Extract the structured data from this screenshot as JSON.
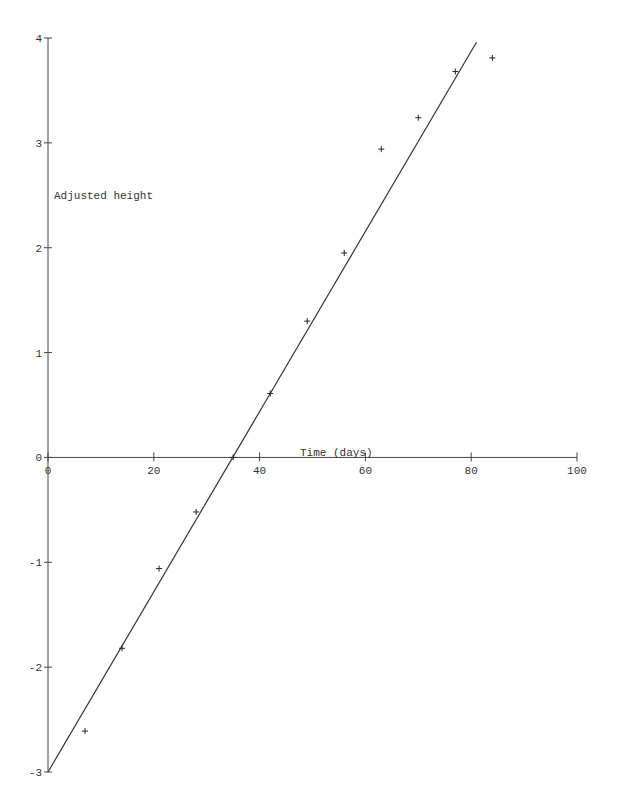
{
  "chart_data": {
    "type": "scatter",
    "title": "",
    "xlabel": "Time (days)",
    "ylabel": "Adjusted height",
    "xlim": [
      0,
      100
    ],
    "ylim": [
      -3,
      4
    ],
    "grid": false,
    "legend": null,
    "x_ticks": [
      0,
      20,
      40,
      60,
      80,
      100
    ],
    "y_ticks": [
      -3,
      -2,
      -1,
      0,
      1,
      2,
      3,
      4
    ],
    "series": [
      {
        "name": "Observed",
        "marker": "+",
        "x": [
          7,
          14,
          21,
          28,
          35,
          42,
          49,
          56,
          63,
          70,
          77,
          84
        ],
        "y": [
          -2.61,
          -1.82,
          -1.06,
          -0.52,
          0.0,
          0.61,
          1.3,
          1.95,
          2.94,
          3.24,
          3.68,
          3.81
        ]
      },
      {
        "name": "Fitted line",
        "type": "line",
        "x": [
          0,
          81
        ],
        "y": [
          -3.0,
          3.96
        ]
      }
    ]
  },
  "labels": {
    "xlabel": "Time (days)",
    "ylabel": "Adjusted height"
  },
  "style": {
    "axis_color": "#444444",
    "line_color": "#333333",
    "marker_color": "#222222"
  }
}
